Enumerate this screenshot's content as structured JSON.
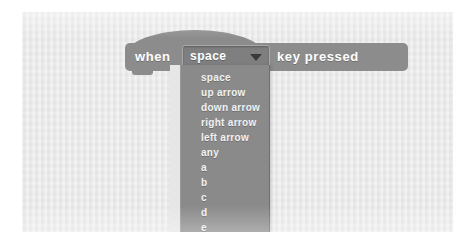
{
  "figure": {
    "kind": "scratch-block-screenshot",
    "background_color": "#e9e9e9",
    "frame_color": "#ffffff"
  },
  "block": {
    "type": "hat-block",
    "category": "events",
    "color": "#8c8c8c",
    "text_color": "#ffffff",
    "label_before": "when",
    "label_after": "key  pressed",
    "full_text": "when space key pressed"
  },
  "dropdown": {
    "name": "key-selector",
    "selected": "space",
    "field_color": "#7f7f7f",
    "arrow_icon": "chevron-down-icon",
    "arrow_color": "#3a3a3a",
    "open": true,
    "menu_color": "#8a8a8a",
    "options": [
      {
        "label": "space"
      },
      {
        "label": "up arrow"
      },
      {
        "label": "down arrow"
      },
      {
        "label": "right arrow"
      },
      {
        "label": "left arrow"
      },
      {
        "label": "any"
      },
      {
        "label": "a"
      },
      {
        "label": "b"
      },
      {
        "label": "c"
      },
      {
        "label": "d"
      },
      {
        "label": "e"
      }
    ]
  }
}
